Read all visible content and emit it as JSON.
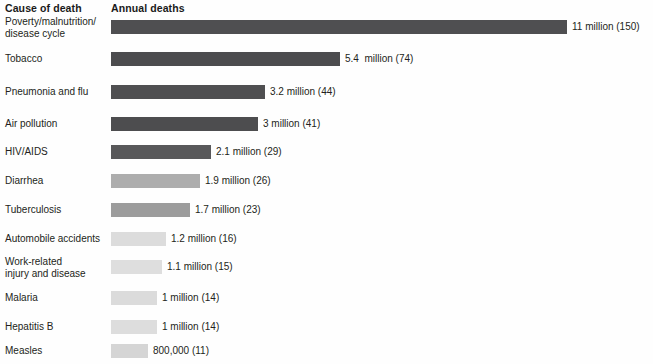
{
  "header": {
    "col_cause": "Cause of death",
    "col_deaths": "Annual deaths"
  },
  "chart_data": {
    "type": "bar",
    "orientation": "horizontal",
    "title": "",
    "subtitle": "",
    "xlabel": "",
    "ylabel": "",
    "xlim": [
      0,
      11
    ],
    "grid": false,
    "legend": null,
    "value_unit": "annual deaths",
    "note": "Parenthetical number is deaths per 100,000 / index shown in source",
    "categories": [
      "Poverty/malnutrition/\ndisease cycle",
      "Tobacco",
      "Pneumonia and flu",
      "Air pollution",
      "HIV/AIDS",
      "Diarrhea",
      "Tuberculosis",
      "Automobile accidents",
      "Work-related\ninjury and disease",
      "Malaria",
      "Hepatitis B",
      "Measles"
    ],
    "values": [
      11,
      5.4,
      3.2,
      3,
      2.1,
      1.9,
      1.7,
      1.2,
      1.1,
      1,
      1,
      0.8
    ],
    "value_labels": [
      "11 million (150)",
      "5.4  million (74)",
      "3.2 million (44)",
      "3 million (41)",
      "2.1 million (29)",
      "1.9 million (26)",
      "1.7 million (23)",
      "1.2 million (16)",
      "1.1 million (15)",
      "1 million (14)",
      "1 million (14)",
      "800,000 (11)"
    ],
    "secondary_values": [
      150,
      74,
      44,
      41,
      29,
      26,
      23,
      16,
      15,
      14,
      14,
      11
    ],
    "bar_colors": [
      "#4f4f51",
      "#4c4c4e",
      "#4f4f51",
      "#4d4d4f",
      "#58585a",
      "#adadad",
      "#9c9c9c",
      "#dcdcdc",
      "#dedede",
      "#dbdbdb",
      "#dddddd",
      "#d5d5d5"
    ],
    "bar_pixel_widths": [
      456,
      229,
      154,
      147,
      100,
      89,
      79,
      55,
      51,
      46,
      46,
      37
    ],
    "row_tops": [
      20,
      52,
      85,
      117,
      145,
      174,
      203,
      232,
      260,
      291,
      320,
      344
    ]
  }
}
